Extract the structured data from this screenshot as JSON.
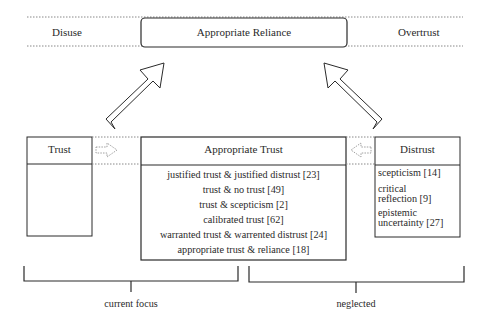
{
  "top_band": {
    "left_label": "Disuse",
    "center_label": "Appropriate Reliance",
    "right_label": "Overtrust"
  },
  "boxes": {
    "trust": {
      "title": "Trust",
      "items": []
    },
    "appropriate_trust": {
      "title": "Appropriate Trust",
      "items": [
        "justified trust & justified distrust [23]",
        "trust & no trust [49]",
        "trust & scepticism [2]",
        "calibrated trust [62]",
        "warranted trust & warrented distrust [24]",
        "appropriate trust & reliance [18]"
      ]
    },
    "distrust": {
      "title": "Distrust",
      "items": [
        {
          "line1": "scepticism [14]",
          "line2": ""
        },
        {
          "line1": "critical",
          "line2": "reflection [9]"
        },
        {
          "line1": "epistemic",
          "line2": "uncertainty [27]"
        }
      ]
    }
  },
  "brackets": {
    "left_label": "current focus",
    "right_label": "neglected"
  },
  "colors": {
    "stroke": "#2a2a2a",
    "dotted": "#888888",
    "background": "#ffffff"
  }
}
